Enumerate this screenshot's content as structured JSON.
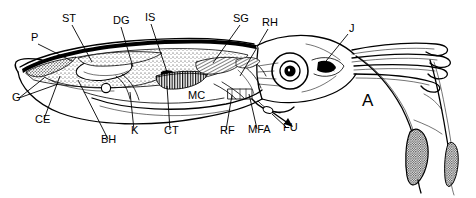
{
  "figure": {
    "panel_label": "A",
    "view": "lateral dissection, anterior to the right",
    "line_color": "#000000",
    "background_color": "#ffffff"
  },
  "labels": [
    {
      "key": "P",
      "text": "P",
      "x": 31,
      "y": 41,
      "leader": [
        [
          38,
          44
        ],
        [
          72,
          61
        ]
      ],
      "anchor_part": "pen-gladius"
    },
    {
      "key": "ST",
      "text": "ST",
      "x": 62,
      "y": 22,
      "leader": [
        [
          72,
          25
        ],
        [
          92,
          62
        ]
      ],
      "anchor_part": "stomach"
    },
    {
      "key": "DG",
      "text": "DG",
      "x": 113,
      "y": 24,
      "leader": [
        [
          121,
          27
        ],
        [
          133,
          67
        ]
      ],
      "anchor_part": "digestive-gland"
    },
    {
      "key": "IS",
      "text": "IS",
      "x": 145,
      "y": 21,
      "leader": [
        [
          151,
          24
        ],
        [
          167,
          72
        ]
      ],
      "anchor_part": "ink-sac"
    },
    {
      "key": "SG",
      "text": "SG",
      "x": 233,
      "y": 22,
      "leader": [
        [
          240,
          25
        ],
        [
          213,
          63
        ]
      ],
      "anchor_part": "salivary-gland"
    },
    {
      "key": "RH",
      "text": "RH",
      "x": 262,
      "y": 26,
      "leader": [
        [
          268,
          29
        ],
        [
          240,
          76
        ]
      ],
      "anchor_part": "radula-head"
    },
    {
      "key": "J",
      "text": "J",
      "x": 349,
      "y": 32,
      "leader": [
        [
          348,
          34
        ],
        [
          322,
          66
        ]
      ],
      "anchor_part": "jaw-beak"
    },
    {
      "key": "G",
      "text": "G",
      "x": 12,
      "y": 101,
      "leader": [
        [
          19,
          98
        ],
        [
          44,
          78
        ]
      ],
      "anchor_part": "gill"
    },
    {
      "key": "CE",
      "text": "CE",
      "x": 35,
      "y": 123,
      "leader": [
        [
          44,
          119
        ],
        [
          60,
          76
        ]
      ],
      "anchor_part": "cecum"
    },
    {
      "key": "BH",
      "text": "BH",
      "x": 101,
      "y": 143,
      "leader": [
        [
          108,
          139
        ],
        [
          78,
          80
        ]
      ],
      "anchor_part": "branchial-heart"
    },
    {
      "key": "K",
      "text": "K",
      "x": 131,
      "y": 134,
      "leader": [
        [
          134,
          130
        ],
        [
          130,
          92
        ]
      ],
      "anchor_part": "kidney"
    },
    {
      "key": "CT",
      "text": "CT",
      "x": 164,
      "y": 134,
      "leader": [
        [
          170,
          130
        ],
        [
          167,
          86
        ]
      ],
      "anchor_part": "ctenidium"
    },
    {
      "key": "MC",
      "text": "MC",
      "x": 188,
      "y": 99,
      "leader": null,
      "anchor_part": "mantle-cavity"
    },
    {
      "key": "RF",
      "text": "RF",
      "x": 220,
      "y": 134,
      "leader": [
        [
          226,
          130
        ],
        [
          232,
          95
        ]
      ],
      "anchor_part": "retractor-funnel"
    },
    {
      "key": "MFA",
      "text": "MFA",
      "x": 248,
      "y": 133,
      "leader": [
        [
          257,
          129
        ],
        [
          249,
          94
        ]
      ],
      "anchor_part": "mantle-funnel-attachment"
    },
    {
      "key": "FU",
      "text": "FU",
      "x": 283,
      "y": 131,
      "leader": [
        [
          286,
          127
        ],
        [
          270,
          113
        ]
      ],
      "anchor_part": "funnel"
    }
  ],
  "anatomy_parts": [
    {
      "key": "P",
      "name": "pen (gladius)"
    },
    {
      "key": "ST",
      "name": "stomach"
    },
    {
      "key": "DG",
      "name": "digestive gland"
    },
    {
      "key": "IS",
      "name": "ink sac"
    },
    {
      "key": "SG",
      "name": "salivary gland"
    },
    {
      "key": "RH",
      "name": "radula / head retractor"
    },
    {
      "key": "J",
      "name": "jaw (beak)"
    },
    {
      "key": "G",
      "name": "gonad"
    },
    {
      "key": "CE",
      "name": "cecum"
    },
    {
      "key": "BH",
      "name": "branchial heart"
    },
    {
      "key": "K",
      "name": "kidney"
    },
    {
      "key": "CT",
      "name": "ctenidium (gill)"
    },
    {
      "key": "MC",
      "name": "mantle cavity"
    },
    {
      "key": "RF",
      "name": "retractor of funnel"
    },
    {
      "key": "MFA",
      "name": "mantle-funnel attachment"
    },
    {
      "key": "FU",
      "name": "funnel"
    }
  ]
}
